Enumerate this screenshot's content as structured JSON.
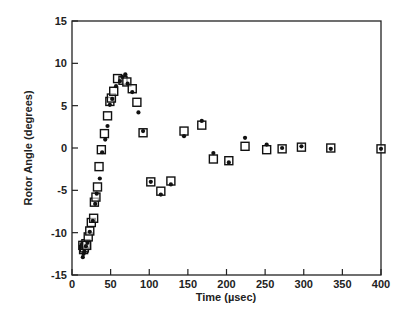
{
  "chart_data": {
    "type": "scatter",
    "title": "",
    "xlabel": "Time (µsec)",
    "ylabel": "Rotor Angle (degrees)",
    "xlim": [
      0,
      400
    ],
    "ylim": [
      -15,
      15
    ],
    "xticks": [
      0,
      50,
      100,
      150,
      200,
      250,
      300,
      350,
      400
    ],
    "yticks": [
      -15,
      -10,
      -5,
      0,
      5,
      10,
      15
    ],
    "grid": false,
    "legend": null,
    "series": [
      {
        "name": "open-squares",
        "marker": "square-open",
        "points": [
          [
            14,
            -11.5
          ],
          [
            15,
            -12.0
          ],
          [
            16,
            -11.8
          ],
          [
            17,
            -11.5
          ],
          [
            18,
            -11.3
          ],
          [
            19,
            -11.5
          ],
          [
            21,
            -10.5
          ],
          [
            23,
            -9.8
          ],
          [
            25,
            -8.8
          ],
          [
            28,
            -8.3
          ],
          [
            29,
            -6.4
          ],
          [
            31,
            -5.8
          ],
          [
            33,
            -4.6
          ],
          [
            35,
            -2.2
          ],
          [
            38,
            -0.2
          ],
          [
            42,
            1.7
          ],
          [
            46,
            3.8
          ],
          [
            49,
            5.5
          ],
          [
            51,
            5.9
          ],
          [
            54,
            6.7
          ],
          [
            59,
            8.2
          ],
          [
            66,
            8.0
          ],
          [
            71,
            7.8
          ],
          [
            78,
            7.0
          ],
          [
            84,
            5.4
          ],
          [
            92,
            1.8
          ],
          [
            102,
            -4.0
          ],
          [
            115,
            -5.1
          ],
          [
            128,
            -3.9
          ],
          [
            145,
            2.0
          ],
          [
            168,
            2.7
          ],
          [
            183,
            -1.3
          ],
          [
            203,
            -1.5
          ],
          [
            224,
            0.2
          ],
          [
            252,
            -0.2
          ],
          [
            272,
            -0.1
          ],
          [
            297,
            0.1
          ],
          [
            335,
            0.0
          ],
          [
            400,
            -0.1
          ]
        ]
      },
      {
        "name": "filled-dots",
        "marker": "circle-filled",
        "points": [
          [
            14,
            -12.9
          ],
          [
            15,
            -12.5
          ],
          [
            16,
            -12.2
          ],
          [
            18,
            -11.6
          ],
          [
            20,
            -11.2
          ],
          [
            23,
            -9.9
          ],
          [
            27,
            -8.6
          ],
          [
            30,
            -6.6
          ],
          [
            32,
            -5.4
          ],
          [
            36,
            -3.6
          ],
          [
            39,
            -0.5
          ],
          [
            43,
            1.0
          ],
          [
            46,
            2.6
          ],
          [
            49,
            5.1
          ],
          [
            52,
            5.8
          ],
          [
            57,
            7.3
          ],
          [
            62,
            7.9
          ],
          [
            65,
            8.4
          ],
          [
            69,
            8.7
          ],
          [
            72,
            7.6
          ],
          [
            78,
            6.6
          ],
          [
            86,
            4.2
          ],
          [
            92,
            2.0
          ],
          [
            102,
            -4.0
          ],
          [
            115,
            -5.5
          ],
          [
            128,
            -4.3
          ],
          [
            145,
            1.4
          ],
          [
            168,
            3.2
          ],
          [
            183,
            -0.6
          ],
          [
            203,
            -1.7
          ],
          [
            224,
            1.2
          ],
          [
            252,
            0.4
          ],
          [
            272,
            0.0
          ],
          [
            297,
            0.2
          ],
          [
            335,
            -0.1
          ],
          [
            400,
            -0.1
          ]
        ]
      }
    ]
  }
}
